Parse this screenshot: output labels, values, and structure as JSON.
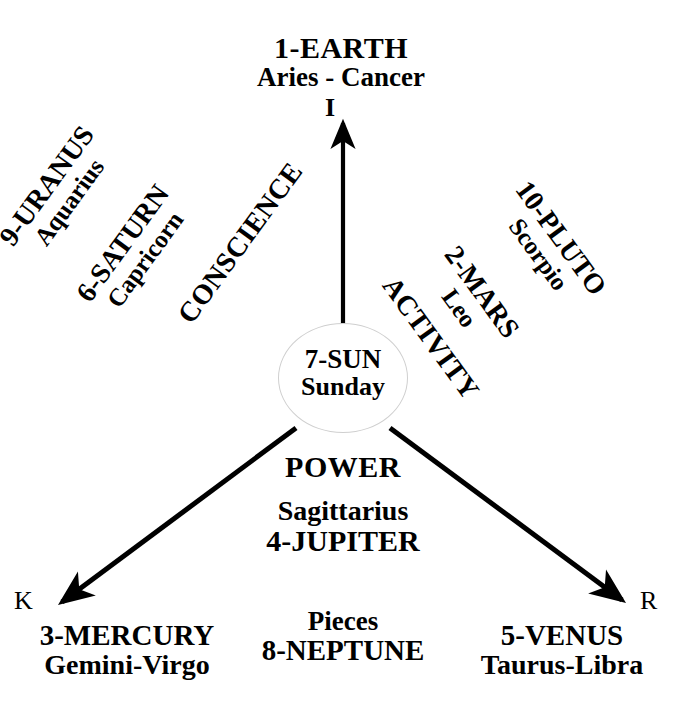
{
  "diagram": {
    "center": {
      "line1": "7-SUN",
      "line2": "Sunday"
    },
    "axes": {
      "up": {
        "letter": "I",
        "line1": "1-EARTH",
        "line2": "Aries - Cancer"
      },
      "lower_left": {
        "letter": "K",
        "line1": "3-MERCURY",
        "line2": "Gemini-Virgo"
      },
      "lower_right": {
        "letter": "R",
        "line1": "5-VENUS",
        "line2": "Taurus-Libra"
      }
    },
    "left_branch": [
      {
        "line1": "9-URANUS",
        "line2": "Aquarius"
      },
      {
        "line1": "6-SATURN",
        "line2": "Capricorn"
      },
      {
        "single": "CONSCIENCE"
      }
    ],
    "right_branch": [
      {
        "line1": "10-PLUTO",
        "line2": "Scorpio"
      },
      {
        "line1": "2-MARS",
        "line2": "Leo"
      },
      {
        "single": "ACTIVITY"
      }
    ],
    "lower_center": {
      "power": "POWER",
      "sign": "Sagittarius",
      "planet": "4-JUPITER"
    },
    "bottom_center": {
      "sign": "Pieces",
      "planet": "8-NEPTUNE"
    },
    "colors": {
      "ink": "#000000",
      "background": "#ffffff",
      "circle_stroke": "#cfcfcf"
    }
  }
}
